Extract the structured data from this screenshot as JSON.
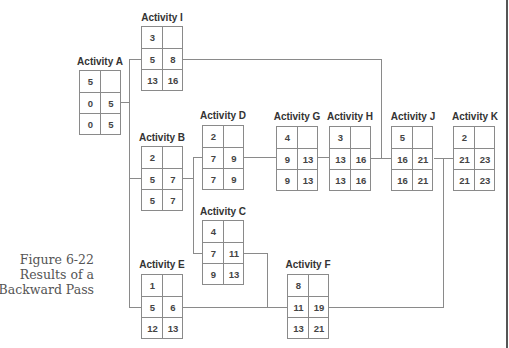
{
  "figure": {
    "caption_line1": "Figure 6-22",
    "caption_line2": "Results of a",
    "caption_line3": "Backward Pass"
  },
  "diagram": {
    "type": "activity-on-node network (backward pass results)",
    "cell_layout": "row0: duration | blank; row1: early start | early finish; row2: late start | late finish",
    "nodes": {
      "A": {
        "label": "Activity A",
        "duration": "5",
        "es": "0",
        "ef": "5",
        "ls": "0",
        "lf": "5"
      },
      "I": {
        "label": "Activity I",
        "duration": "3",
        "es": "5",
        "ef": "8",
        "ls": "13",
        "lf": "16"
      },
      "B": {
        "label": "Activity B",
        "duration": "2",
        "es": "5",
        "ef": "7",
        "ls": "5",
        "lf": "7"
      },
      "D": {
        "label": "Activity D",
        "duration": "2",
        "es": "7",
        "ef": "9",
        "ls": "7",
        "lf": "9"
      },
      "C": {
        "label": "Activity C",
        "duration": "4",
        "es": "7",
        "ef": "11",
        "ls": "9",
        "lf": "13"
      },
      "E": {
        "label": "Activity E",
        "duration": "1",
        "es": "5",
        "ef": "6",
        "ls": "12",
        "lf": "13"
      },
      "G": {
        "label": "Activity G",
        "duration": "4",
        "es": "9",
        "ef": "13",
        "ls": "9",
        "lf": "13"
      },
      "H": {
        "label": "Activity H",
        "duration": "3",
        "es": "13",
        "ef": "16",
        "ls": "13",
        "lf": "16"
      },
      "J": {
        "label": "Activity J",
        "duration": "5",
        "es": "16",
        "ef": "21",
        "ls": "16",
        "lf": "21"
      },
      "K": {
        "label": "Activity K",
        "duration": "2",
        "es": "21",
        "ef": "23",
        "ls": "21",
        "lf": "23"
      },
      "F": {
        "label": "Activity F",
        "duration": "8",
        "es": "11",
        "ef": "19",
        "ls": "13",
        "lf": "21"
      }
    },
    "edges": [
      [
        "A",
        "I"
      ],
      [
        "A",
        "B"
      ],
      [
        "A",
        "E"
      ],
      [
        "B",
        "D"
      ],
      [
        "B",
        "C"
      ],
      [
        "D",
        "G"
      ],
      [
        "G",
        "H"
      ],
      [
        "H",
        "J"
      ],
      [
        "I",
        "J"
      ],
      [
        "C",
        "F"
      ],
      [
        "E",
        "F"
      ],
      [
        "J",
        "K"
      ],
      [
        "F",
        "K"
      ]
    ]
  }
}
